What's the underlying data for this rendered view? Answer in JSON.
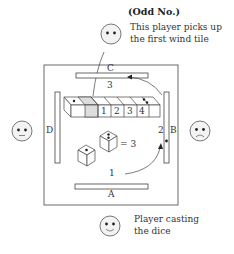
{
  "title": "(Odd No.)",
  "top_player": {
    "note_line1": "This player picks up",
    "note_line2": "the first wind tile",
    "face": "neutral"
  },
  "bottom_player": {
    "note_line1": "Player casting",
    "note_line2": "the dice",
    "face": "smile"
  },
  "left_player": {
    "face": "neutral"
  },
  "right_player": {
    "face": "frown"
  },
  "walls": {
    "top": "C",
    "bottom": "A",
    "left": "D",
    "right": "B"
  },
  "counts": {
    "top_count": "3",
    "right_count": "2",
    "bottom_count": "1"
  },
  "wall_tiles": [
    "1",
    "2",
    "3",
    "4"
  ],
  "dice": {
    "die1_pips": 1,
    "die2_pips": 2,
    "sum_label": "= 3"
  }
}
